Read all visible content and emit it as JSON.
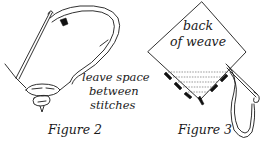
{
  "figures": [
    {
      "id": "figure-2",
      "caption": "Figure 2",
      "annotation_lines": [
        "leave space",
        "between",
        "stitches"
      ]
    },
    {
      "id": "figure-3",
      "caption": "Figure 3",
      "label_lines": [
        "back",
        "of weave"
      ]
    }
  ],
  "colors": {
    "ink": "#1a1a1a",
    "background": "#ffffff"
  }
}
